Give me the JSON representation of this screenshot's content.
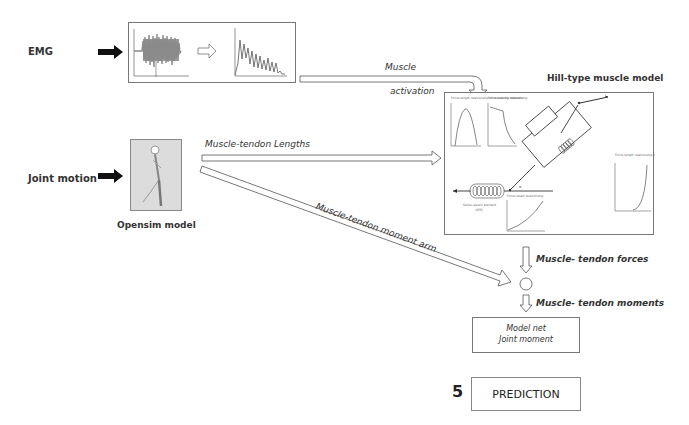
{
  "inputs": {
    "emg": {
      "label": "EMG"
    },
    "joint_motion": {
      "label": "Joint motion"
    },
    "opensim": {
      "label": "Opensim model"
    }
  },
  "arrows": {
    "muscle_activation": {
      "line1": "Muscle",
      "line2": "activation"
    },
    "muscle_tendon_lengths": {
      "label": "Muscle-tendon Lengths"
    },
    "muscle_tendon_moment_arm": {
      "label": "Muscle-tendon moment arm"
    },
    "muscle_tendon_forces": {
      "label": "Muscle- tendon forces"
    },
    "muscle_tendon_moments": {
      "label": "Muscle- tendon moments"
    }
  },
  "hill_model": {
    "title": "Hill-type muscle model",
    "plots": [
      {
        "title": "Force-length relationship of contractile element"
      },
      {
        "title": "Force-velocity relationship"
      },
      {
        "title": "Force-strain relationship"
      },
      {
        "title": "Force-length relationship of passive element"
      }
    ],
    "elements": {
      "muscle_fibre": "Muscle fibre",
      "contractile": "Contractile element",
      "parallel": "Parallel elastic element",
      "series": "Series elastic element (SEE)",
      "angle": "α"
    }
  },
  "output": {
    "model_net_line1": "Model net",
    "model_net_line2": "Joint moment",
    "step_number": "5",
    "prediction": "PREDICTION"
  },
  "colors": {
    "line": "#555555",
    "box_border": "#777777",
    "emg_fill": "#8a8a8a",
    "opensim_bg": "#dcdcdc"
  }
}
